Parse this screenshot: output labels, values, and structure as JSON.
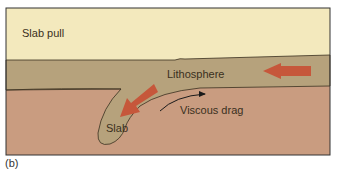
{
  "figure": {
    "caption": "(b)",
    "labels": {
      "slab_pull": "Slab pull",
      "lithosphere": "Lithosphere",
      "viscous_drag": "Viscous drag",
      "slab": "Slab"
    },
    "colors": {
      "upper_layer": "#f3e9bd",
      "lithosphere": "#b6a27c",
      "mantle": "#c99c80",
      "arrow": "#c6573b",
      "outline": "#3a3020"
    }
  }
}
